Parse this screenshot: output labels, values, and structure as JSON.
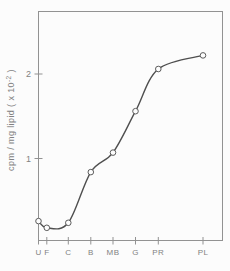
{
  "figure": {
    "background": "#fcfcfc"
  },
  "chart_data": {
    "type": "line",
    "title": "",
    "xlabel": "",
    "ylabel": {
      "text": "cpm / mg lipid ( x 10",
      "sup": "-2",
      "suffix": " )"
    },
    "categories": [
      "U",
      "F",
      "C",
      "B",
      "MB",
      "G",
      "PR",
      "PL"
    ],
    "values": [
      0.26,
      0.18,
      0.24,
      0.84,
      1.07,
      1.56,
      2.06,
      2.22
    ],
    "x_frac": [
      0,
      0.045,
      0.162,
      0.284,
      0.405,
      0.527,
      0.651,
      0.894
    ],
    "series_name": "cpm per mg lipid",
    "yticks": [
      1,
      2
    ],
    "ylim": [
      0.03,
      2.74
    ],
    "grid": false,
    "legend_position": "none",
    "marker": "open-circle",
    "colors": {
      "line": "#4f4f4f",
      "axis": "#929292",
      "tick_label": "#828282",
      "marker_fill": "#fdfdfd",
      "marker_stroke": "#5c5c5c"
    }
  }
}
